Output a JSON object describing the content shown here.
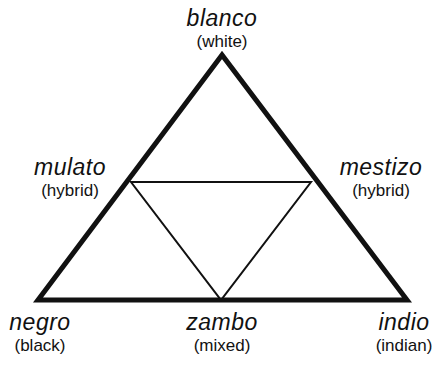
{
  "diagram": {
    "title": "",
    "colors": {
      "line": "#111111",
      "background": "#ffffff"
    },
    "outer_triangle": {
      "points": [
        [
          222,
          55
        ],
        [
          38,
          300
        ],
        [
          407,
          300
        ]
      ],
      "stroke_width": 5
    },
    "inner_triangle": {
      "points": [
        [
          131,
          182
        ],
        [
          311,
          182
        ],
        [
          221,
          300
        ]
      ],
      "stroke_width": 2
    },
    "nodes": {
      "blanco": {
        "term": "blanco",
        "gloss": "(white)"
      },
      "mulato": {
        "term": "mulato",
        "gloss": "(hybrid)"
      },
      "mestizo": {
        "term": "mestizo",
        "gloss": "(hybrid)"
      },
      "negro": {
        "term": "negro",
        "gloss": "(black)"
      },
      "zambo": {
        "term": "zambo",
        "gloss": "(mixed)"
      },
      "indio": {
        "term": "indio",
        "gloss": "(indian)"
      }
    }
  }
}
